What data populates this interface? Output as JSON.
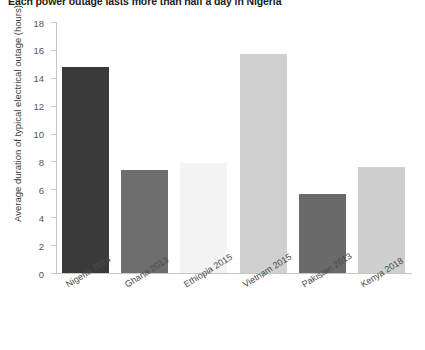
{
  "chart_data": {
    "type": "bar",
    "title": "Each power outage lasts more than half a day in Nigeria",
    "xlabel": "",
    "ylabel": "Average duration of typical electrical outage (hours)",
    "categories": [
      "Nigeria 2014",
      "Ghana 2013",
      "Ethiopia 2015",
      "Vietnam 2015",
      "Pakistan 2013",
      "Kenya 2018"
    ],
    "values": [
      14.8,
      7.4,
      7.9,
      15.7,
      5.7,
      7.6
    ],
    "bar_colors": [
      "#3a3a3a",
      "#6e6e6e",
      "#f4f4f4",
      "#d0d0d0",
      "#6a6a6a",
      "#cfcfcf"
    ],
    "ylim": [
      0,
      18
    ],
    "yticks": [
      0,
      2,
      4,
      6,
      8,
      10,
      12,
      14,
      16,
      18
    ],
    "ytick_labels": [
      "0",
      "2",
      "4",
      "6",
      "8",
      "10",
      "12",
      "14",
      "16",
      "18"
    ],
    "grid": false,
    "legend": "none",
    "axis_color": "#c6c6c6"
  }
}
